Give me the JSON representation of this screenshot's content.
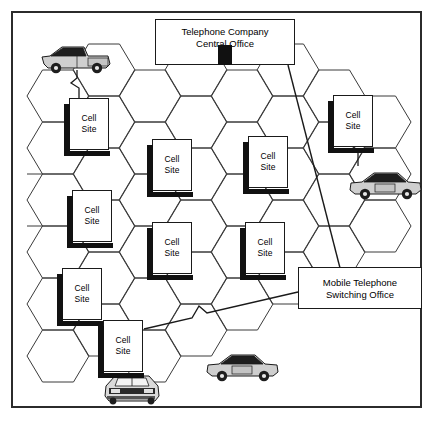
{
  "diagram": {
    "type": "network-topology",
    "frame": {
      "border_color": "#2b2b2b"
    }
  },
  "nodes": {
    "central_office": {
      "label_line1": "Telephone Company",
      "label_line2": "Central Office",
      "x": 155,
      "y": 19,
      "w": 140,
      "h": 46
    },
    "mtso": {
      "label_line1": "Mobile Telephone",
      "label_line2": "Switching Office",
      "x": 298,
      "y": 267,
      "w": 124,
      "h": 42
    }
  },
  "cell_sites": [
    {
      "id": "cs1",
      "line1": "Cell",
      "line2": "Site",
      "x": 69,
      "y": 98
    },
    {
      "id": "cs2",
      "line1": "Cell",
      "line2": "Site",
      "x": 333,
      "y": 95
    },
    {
      "id": "cs3",
      "line1": "Cell",
      "line2": "Site",
      "x": 152,
      "y": 139
    },
    {
      "id": "cs4",
      "line1": "Cell",
      "line2": "Site",
      "x": 248,
      "y": 136
    },
    {
      "id": "cs5",
      "line1": "Cell",
      "line2": "Site",
      "x": 72,
      "y": 190
    },
    {
      "id": "cs6",
      "line1": "Cell",
      "line2": "Site",
      "x": 152,
      "y": 222
    },
    {
      "id": "cs7",
      "line1": "Cell",
      "line2": "Site",
      "x": 245,
      "y": 222
    },
    {
      "id": "cs8",
      "line1": "Cell",
      "line2": "Site",
      "x": 62,
      "y": 268
    },
    {
      "id": "cs9",
      "line1": "Cell",
      "line2": "Site",
      "x": 103,
      "y": 320
    }
  ],
  "vehicles": [
    {
      "id": "truck-top-left",
      "kind": "pickup-truck-side",
      "x": 40,
      "y": 44,
      "facing": "left",
      "color": "#cfcfcf"
    },
    {
      "id": "car-right",
      "kind": "car-side",
      "x": 348,
      "y": 170,
      "facing": "right",
      "color": "#cfcfcf"
    },
    {
      "id": "car-bottom",
      "kind": "car-side",
      "x": 205,
      "y": 352,
      "facing": "right",
      "color": "#cfcfcf"
    },
    {
      "id": "car-bottom-front",
      "kind": "car-front",
      "x": 103,
      "y": 372,
      "color": "#d9d9d9"
    }
  ],
  "rf_links": [
    {
      "from": "truck-top-left",
      "to": "cs1"
    },
    {
      "from": "car-right",
      "to": "cs2"
    }
  ],
  "colors": {
    "line": "#1a1a1a",
    "shadow": "#111111",
    "hex_stroke": "#3a3a3a",
    "paper": "#ffffff",
    "vehicle_body": "#cfcfcf",
    "vehicle_top": "#1e1e1e"
  },
  "hex_grid": {
    "orientation": "flat-top",
    "hex_width": 62,
    "hex_height": 52,
    "col_pitch": 46,
    "row_pitch": 52,
    "stroke": "#3a3a3a"
  }
}
